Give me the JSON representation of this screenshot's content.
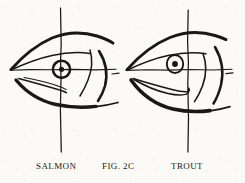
{
  "figure": {
    "domain": "scanned-book-illustration",
    "background_color": "#fbfaf7",
    "ink_color": "#1a1714",
    "width": 245,
    "height": 183,
    "caption": {
      "left_label": "Salmon",
      "center_label": "Fig. 2c",
      "right_label": "Trout"
    },
    "panels": [
      {
        "id": "salmon",
        "name": "salmon-head",
        "label": "Salmon",
        "side": "left",
        "eye": {
          "style": "ring-with-crosshair",
          "center_x": 62,
          "center_y": 69,
          "outer_radius": 9,
          "pupil_radius": 2.5,
          "description": "Eye circled by a heavy ring; vertical and horizontal reference lines cross exactly at the pupil"
        },
        "axes": {
          "vertical_x": 61,
          "vertical_top": 8,
          "vertical_bottom": 152,
          "horizontal_y": 70,
          "horizontal_left": 10,
          "horizontal_right": 116,
          "note": "Vertical axis passes through eye centre"
        },
        "mouth": "short jaw, upper lip ends beneath the eye",
        "gill_curves": 1
      },
      {
        "id": "trout",
        "name": "trout-head",
        "label": "Trout",
        "side": "right",
        "eye": {
          "style": "plain-ring-with-pupil",
          "center_x": 175,
          "center_y": 64,
          "outer_radius": 8,
          "pupil_radius": 2.8,
          "description": "Plain elliptical eye with solid pupil; vertical reference line falls behind the eye"
        },
        "axes": {
          "vertical_x": 188,
          "vertical_top": 10,
          "vertical_bottom": 152,
          "horizontal_y": 70,
          "horizontal_left": 126,
          "horizontal_right": 232,
          "note": "Vertical axis passes behind the eye, through the jaw hinge"
        },
        "mouth": "long jaw, upper lip extends past the vertical reference line",
        "gill_curves": 2
      }
    ],
    "comparison_note": "Fig. 2c contrasts salmon and trout head proportions: the salmon's eye sits on the vertical axis, the trout's jaw extends behind it."
  }
}
